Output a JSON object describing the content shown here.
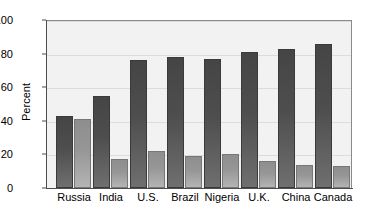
{
  "chart_data": {
    "type": "bar",
    "title": "",
    "subtitle": "",
    "xlabel": "",
    "ylabel": "Percent",
    "ylim": [
      0,
      100
    ],
    "yticks": [
      0,
      20,
      40,
      60,
      80,
      100
    ],
    "ytick_labels": [
      "0",
      "20",
      "40",
      "60",
      "80",
      "100"
    ],
    "grid": true,
    "legend": "none",
    "categories": [
      "Russia",
      "India",
      "U.S.",
      "Brazil",
      "Nigeria",
      "U.K.",
      "China",
      "Canada"
    ],
    "series": [
      {
        "name": "series-1-dark",
        "color": "#4a4a4a",
        "values": [
          43,
          55,
          76,
          78,
          77,
          81,
          83,
          86
        ]
      },
      {
        "name": "series-2-light",
        "color": "#959595",
        "values": [
          41,
          17,
          22,
          19,
          20,
          16,
          14,
          13
        ]
      }
    ]
  },
  "axes": {
    "y_label": "Percent",
    "y_tick_labels": [
      "0",
      "20",
      "40",
      "60",
      "80",
      "100"
    ],
    "x_tick_labels": [
      "Russia",
      "India",
      "U.S.",
      "Brazil",
      "Nigeria",
      "U.K.",
      "China",
      "Canada"
    ]
  },
  "colors": {
    "plot_background": "#f2f2f2",
    "page_background": "#ffffff",
    "axis": "#4d4d4d",
    "gridline": "#dcdcdc",
    "bar_dark": "#4a4a4a",
    "bar_light": "#959595"
  }
}
